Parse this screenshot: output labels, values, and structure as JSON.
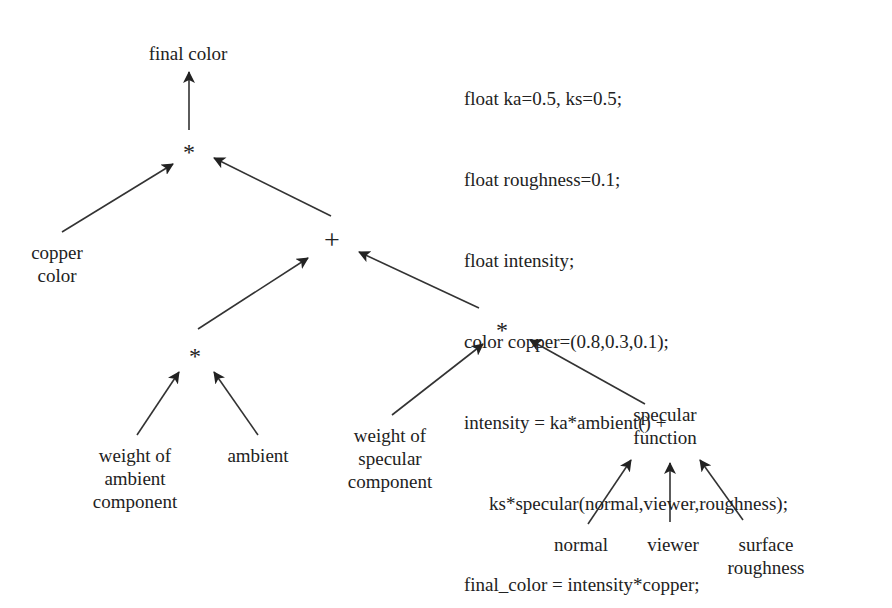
{
  "diagram": {
    "type": "expression-tree",
    "nodes": {
      "final_color": "final color",
      "mult_top": "*",
      "copper_color": [
        "copper",
        "color"
      ],
      "plus": "+",
      "mult_ambient": "*",
      "mult_specular": "*",
      "weight_ambient": [
        "weight of",
        "ambient",
        "component"
      ],
      "ambient": "ambient",
      "weight_specular": [
        "weight of",
        "specular",
        "component"
      ],
      "specular_function": [
        "specular",
        "function"
      ],
      "normal": "normal",
      "viewer": "viewer",
      "surface_roughness": [
        "surface",
        "roughness"
      ]
    },
    "edges": [
      {
        "from": "mult_top",
        "to": "final_color"
      },
      {
        "from": "copper_color",
        "to": "mult_top"
      },
      {
        "from": "plus",
        "to": "mult_top"
      },
      {
        "from": "mult_ambient",
        "to": "plus"
      },
      {
        "from": "mult_specular",
        "to": "plus"
      },
      {
        "from": "weight_ambient",
        "to": "mult_ambient"
      },
      {
        "from": "ambient",
        "to": "mult_ambient"
      },
      {
        "from": "weight_specular",
        "to": "mult_specular"
      },
      {
        "from": "specular_function",
        "to": "mult_specular"
      },
      {
        "from": "normal",
        "to": "specular_function"
      },
      {
        "from": "viewer",
        "to": "specular_function"
      },
      {
        "from": "surface_roughness",
        "to": "specular_function"
      }
    ]
  },
  "code": {
    "lines": [
      "float ka=0.5, ks=0.5;",
      "float roughness=0.1;",
      "float intensity;",
      "color copper=(0.8,0.3,0.1);",
      "intensity = ka*ambient() +",
      "ks*specular(normal,viewer,roughness);",
      "final_color = intensity*copper;"
    ]
  },
  "colors": {
    "ink": "#222222",
    "background": "#ffffff"
  }
}
